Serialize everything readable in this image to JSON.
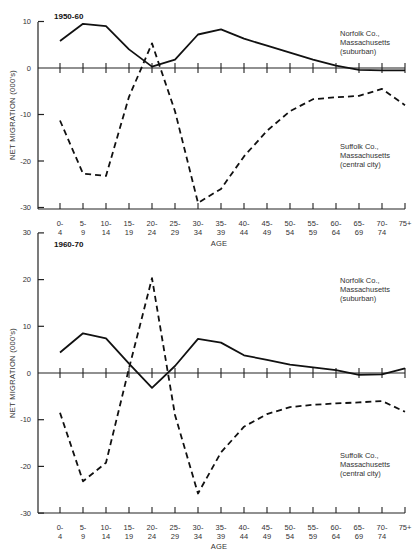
{
  "figure": {
    "ylabel": "NET MIGRATION (000's)",
    "xlabel": "AGE",
    "age_groups": [
      "0-4",
      "5-9",
      "10-14",
      "15-19",
      "20-24",
      "25-29",
      "30-34",
      "35-39",
      "40-44",
      "45-49",
      "50-54",
      "55-59",
      "60-64",
      "65-69",
      "70-74",
      "75+"
    ],
    "age_labels_top": [
      "0-",
      "5-",
      "10-",
      "15-",
      "20-",
      "25-",
      "30-",
      "35-",
      "40-",
      "45-",
      "50-",
      "55-",
      "60-",
      "65-",
      "70-",
      "75+"
    ],
    "age_labels_bottom": [
      "4",
      "9",
      "14",
      "19",
      "24",
      "29",
      "34",
      "39",
      "44",
      "49",
      "54",
      "59",
      "64",
      "69",
      "74",
      ""
    ],
    "colors": {
      "line": "#111111",
      "axis": "#222222",
      "text": "#333333"
    }
  },
  "panels": [
    {
      "title": "1950-60",
      "y_ticks": [
        "10",
        "0",
        "-10",
        "-20",
        "-30"
      ],
      "legend_norfolk": [
        "Norfolk Co.,",
        "Massachusetts",
        "(suburban)"
      ],
      "legend_suffolk": [
        "Suffolk Co.,",
        "Massachusetts",
        "(central city)"
      ]
    },
    {
      "title": "1960-70",
      "y_ticks": [
        "30",
        "20",
        "10",
        "0",
        "-10",
        "-20",
        "-30"
      ],
      "legend_norfolk": [
        "Norfolk Co.,",
        "Massachusetts",
        "(suburban)"
      ],
      "legend_suffolk": [
        "Suffolk Co.,",
        "Massachusetts",
        "(central city)"
      ]
    }
  ],
  "chart_data": [
    {
      "type": "line",
      "title": "1950-60",
      "xlabel": "AGE",
      "ylabel": "NET MIGRATION (000's)",
      "ylim": [
        -30,
        10
      ],
      "grid": false,
      "categories": [
        "0-4",
        "5-9",
        "10-14",
        "15-19",
        "20-24",
        "25-29",
        "30-34",
        "35-39",
        "40-44",
        "45-49",
        "50-54",
        "55-59",
        "60-64",
        "65-69",
        "70-74",
        "75+"
      ],
      "series": [
        {
          "name": "Norfolk Co., Massachusetts (suburban)",
          "style": "solid",
          "values": [
            5.8,
            9.5,
            9.0,
            4.0,
            0.3,
            1.8,
            7.2,
            8.3,
            6.3,
            4.8,
            3.3,
            1.8,
            0.5,
            -0.4,
            -0.5,
            -0.5
          ]
        },
        {
          "name": "Suffolk Co., Massachusetts (central city)",
          "style": "dashed",
          "values": [
            -11.3,
            -22.7,
            -23.2,
            -6.2,
            5.3,
            -9.3,
            -29.0,
            -26.0,
            -19.0,
            -13.5,
            -9.3,
            -6.7,
            -6.3,
            -6.0,
            -4.5,
            -8.0
          ]
        }
      ],
      "legend_position": "right (inline labels)"
    },
    {
      "type": "line",
      "title": "1960-70",
      "xlabel": "AGE",
      "ylabel": "NET MIGRATION (000's)",
      "ylim": [
        -30,
        30
      ],
      "grid": false,
      "categories": [
        "0-4",
        "5-9",
        "10-14",
        "15-19",
        "20-24",
        "25-29",
        "30-34",
        "35-39",
        "40-44",
        "45-49",
        "50-54",
        "55-59",
        "60-64",
        "65-69",
        "70-74",
        "75+"
      ],
      "series": [
        {
          "name": "Norfolk Co., Massachusetts (suburban)",
          "style": "solid",
          "values": [
            4.4,
            8.5,
            7.4,
            2.0,
            -3.2,
            1.5,
            7.3,
            6.5,
            3.8,
            2.8,
            1.8,
            1.2,
            0.6,
            -0.4,
            -0.3,
            1.0
          ]
        },
        {
          "name": "Suffolk Co., Massachusetts (central city)",
          "style": "dashed",
          "values": [
            -8.5,
            -23.2,
            -19.2,
            1.0,
            20.3,
            -9.0,
            -25.8,
            -17.0,
            -11.5,
            -8.8,
            -7.3,
            -6.8,
            -6.5,
            -6.3,
            -6.0,
            -8.3
          ]
        }
      ],
      "legend_position": "right (inline labels)"
    }
  ]
}
